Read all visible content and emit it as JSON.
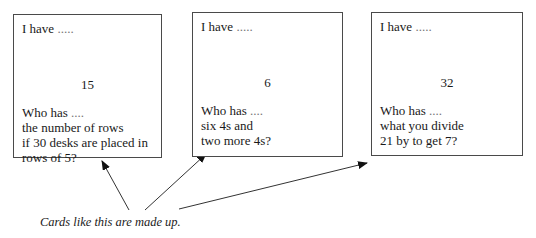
{
  "cards": [
    {
      "have_label": "I have",
      "have_dots": " .....",
      "number": "15",
      "who_label": "Who has",
      "who_dots": " ....",
      "question_lines": [
        "the number of rows",
        "if 30 desks are placed in",
        "rows of 5?"
      ]
    },
    {
      "have_label": "I have",
      "have_dots": " .....",
      "number": "6",
      "who_label": "Who has",
      "who_dots": " ....",
      "question_lines": [
        "six 4s and",
        "two more 4s?"
      ]
    },
    {
      "have_label": "I have",
      "have_dots": " .....",
      "number": "32",
      "who_label": "Who has",
      "who_dots": " ....",
      "question_lines": [
        "what you divide",
        "21 by to get 7?"
      ]
    }
  ],
  "caption": "Cards like this are made up."
}
